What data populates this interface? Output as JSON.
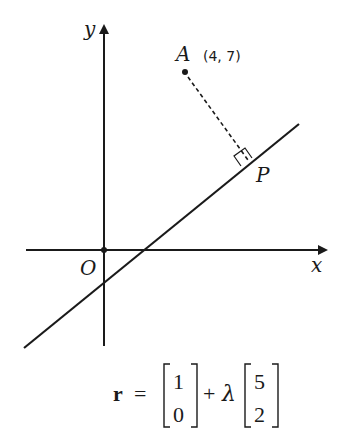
{
  "diagram": {
    "axes": {
      "x_label": "x",
      "y_label": "y",
      "origin_label": "O"
    },
    "point_A": {
      "label": "A",
      "coords": "(4, 7)"
    },
    "foot_P": {
      "label": "P"
    },
    "equation": {
      "lhs": "r",
      "equals": "=",
      "vector1": [
        "1",
        "0"
      ],
      "plus": "+",
      "param": "λ",
      "vector2": [
        "5",
        "2"
      ]
    },
    "colors": {
      "ink": "#1a1a1a",
      "background": "#ffffff"
    }
  }
}
